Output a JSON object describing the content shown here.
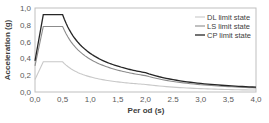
{
  "chart_data": {
    "type": "line",
    "title": "",
    "xlabel": "Per od (s)",
    "ylabel": "Acceleration (g)",
    "xlim": [
      0,
      4
    ],
    "ylim": [
      0,
      1
    ],
    "x_ticks": [
      "0,0",
      "0,5",
      "1,0",
      "1,5",
      "2,0",
      "2.5",
      "3,0",
      "3,5",
      "4,0"
    ],
    "x_tick_values": [
      0,
      0.5,
      1,
      1.5,
      2,
      2.5,
      3,
      3.5,
      4
    ],
    "y_ticks": [
      "0,0",
      "0,2",
      "0,4",
      "0,6",
      "0,8",
      "1,0"
    ],
    "y_tick_values": [
      0,
      0.2,
      0.4,
      0.6,
      0.8,
      1.0
    ],
    "grid": false,
    "legend_position": "top-right",
    "x": [
      0,
      0.15,
      0.5,
      0.75,
      1.0,
      1.25,
      1.5,
      1.75,
      2.0,
      2.5,
      3.0,
      3.5,
      4.0
    ],
    "series": [
      {
        "name": "DL limit state",
        "color": "#c8c8c8",
        "values": [
          0.15,
          0.36,
          0.36,
          0.24,
          0.18,
          0.144,
          0.12,
          0.103,
          0.09,
          0.058,
          0.04,
          0.029,
          0.023
        ]
      },
      {
        "name": "LS limit state",
        "color": "#8c8c8c",
        "values": [
          0.31,
          0.78,
          0.78,
          0.52,
          0.39,
          0.312,
          0.26,
          0.223,
          0.195,
          0.125,
          0.087,
          0.064,
          0.049
        ]
      },
      {
        "name": "CP limit state",
        "color": "#262626",
        "values": [
          0.37,
          0.92,
          0.92,
          0.613,
          0.46,
          0.368,
          0.307,
          0.263,
          0.23,
          0.147,
          0.102,
          0.075,
          0.058
        ]
      }
    ]
  }
}
